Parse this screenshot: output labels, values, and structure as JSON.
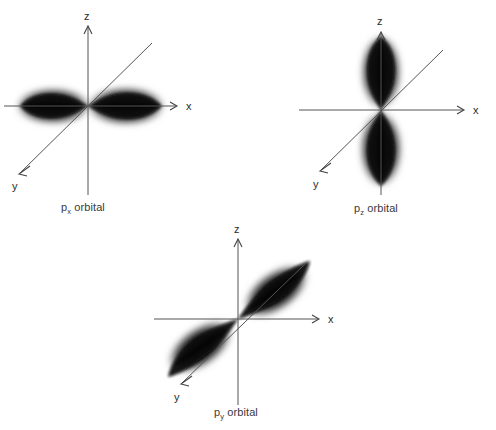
{
  "figure": {
    "background_color": "#ffffff",
    "axis_color": "#555555",
    "lobe_color": "#000000",
    "label_color": "#2b2b2b"
  },
  "orbitals": [
    {
      "id": "px",
      "caption_symbol": "p",
      "caption_subscript": "x",
      "caption_suffix": " orbital",
      "caption_full": "px orbital",
      "lobe_axis": "x",
      "lobe_orientation_deg": 0,
      "axes": [
        {
          "name": "x-axis",
          "label": "x",
          "direction": "right"
        },
        {
          "name": "z-axis",
          "label": "z",
          "direction": "up"
        },
        {
          "name": "y-axis",
          "label": "y",
          "direction": "down-left"
        }
      ]
    },
    {
      "id": "pz",
      "caption_symbol": "p",
      "caption_subscript": "z",
      "caption_suffix": " orbital",
      "caption_full": "pz orbital",
      "lobe_axis": "z",
      "lobe_orientation_deg": 90,
      "axes": [
        {
          "name": "x-axis",
          "label": "x",
          "direction": "right"
        },
        {
          "name": "z-axis",
          "label": "z",
          "direction": "up"
        },
        {
          "name": "y-axis",
          "label": "y",
          "direction": "down-left"
        }
      ]
    },
    {
      "id": "py",
      "caption_symbol": "p",
      "caption_subscript": "y",
      "caption_suffix": " orbital",
      "caption_full": "py orbital",
      "lobe_axis": "y",
      "lobe_orientation_deg": 35,
      "axes": [
        {
          "name": "x-axis",
          "label": "x",
          "direction": "right"
        },
        {
          "name": "z-axis",
          "label": "z",
          "direction": "up"
        },
        {
          "name": "y-axis",
          "label": "y",
          "direction": "down-left"
        }
      ]
    }
  ]
}
